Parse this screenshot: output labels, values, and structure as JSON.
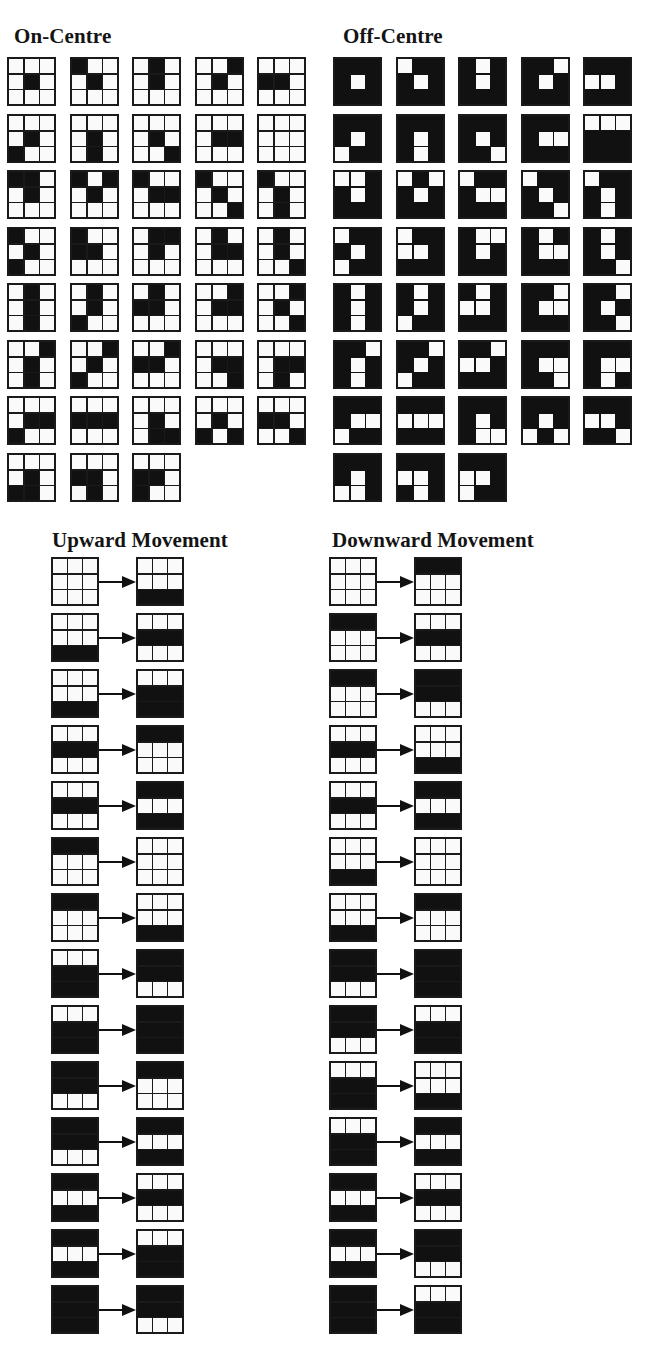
{
  "sections": {
    "on_centre": {
      "title": "On-Centre",
      "title_pos": [
        14,
        24
      ],
      "origin": [
        7,
        57
      ],
      "pitch": [
        62.5,
        56.5
      ],
      "cols": 5,
      "inverted": false,
      "patterns": [
        "000010000",
        "100010000",
        "010010000",
        "001010000",
        "000110000",
        "000010100",
        "000010010",
        "000010001",
        "000011000",
        "000000000",
        "110010000",
        "101010000",
        "100011000",
        "100010001",
        "100010010",
        "100010100",
        "100110000",
        "011010000",
        "010011000",
        "010010001",
        "010010010",
        "010010100",
        "010110000",
        "001011000",
        "001010001",
        "001010010",
        "001010100",
        "001110000",
        "000011001",
        "000011010",
        "000011100",
        "000111000",
        "000010011",
        "000010101",
        "000110001",
        "000010110",
        "000110010",
        "000110100"
      ]
    },
    "off_centre": {
      "title": "Off-Centre",
      "title_pos": [
        343,
        24
      ],
      "origin": [
        333,
        57
      ],
      "pitch": [
        62.5,
        56.5
      ],
      "cols": 5,
      "inverted": true,
      "patterns": [
        "000010000",
        "100010000",
        "010010000",
        "001010000",
        "000110000",
        "000010100",
        "000010010",
        "000010001",
        "000011000",
        "111000000",
        "110010000",
        "101010000",
        "100011000",
        "100010001",
        "100010010",
        "100010100",
        "100110000",
        "011010000",
        "010011000",
        "010010001",
        "010010010",
        "010010100",
        "010110000",
        "001011000",
        "001010001",
        "001010010",
        "001010100",
        "001110000",
        "000011001",
        "000011010",
        "000011100",
        "000111000",
        "000010011",
        "000010101",
        "000110001",
        "000010110",
        "000110010",
        "000110100"
      ]
    },
    "upward": {
      "title": "Upward Movement",
      "title_pos": [
        52,
        528
      ],
      "left_x": 51,
      "right_x": 136,
      "top_y": 557,
      "row_pitch": 56,
      "transitions": [
        [
          "000",
          "001"
        ],
        [
          "001",
          "010"
        ],
        [
          "001",
          "011"
        ],
        [
          "010",
          "100"
        ],
        [
          "010",
          "101"
        ],
        [
          "100",
          "000"
        ],
        [
          "100",
          "001"
        ],
        [
          "011",
          "110"
        ],
        [
          "011",
          "111"
        ],
        [
          "110",
          "100"
        ],
        [
          "110",
          "101"
        ],
        [
          "101",
          "010"
        ],
        [
          "101",
          "011"
        ],
        [
          "111",
          "110"
        ]
      ]
    },
    "downward": {
      "title": "Downward Movement",
      "title_pos": [
        332,
        528
      ],
      "left_x": 329,
      "right_x": 414,
      "top_y": 557,
      "row_pitch": 56,
      "transitions": [
        [
          "000",
          "100"
        ],
        [
          "100",
          "010"
        ],
        [
          "100",
          "110"
        ],
        [
          "010",
          "001"
        ],
        [
          "010",
          "101"
        ],
        [
          "001",
          "000"
        ],
        [
          "001",
          "100"
        ],
        [
          "110",
          "111"
        ],
        [
          "110",
          "011"
        ],
        [
          "011",
          "001"
        ],
        [
          "011",
          "101"
        ],
        [
          "101",
          "010"
        ],
        [
          "101",
          "110"
        ],
        [
          "111",
          "011"
        ]
      ]
    }
  },
  "colors": {
    "ink": "#111111",
    "paper": "#fafafa"
  }
}
